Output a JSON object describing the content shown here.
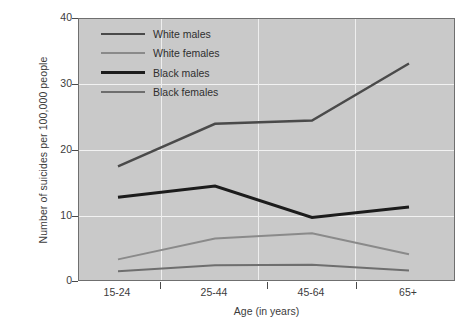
{
  "chart_data": {
    "type": "line",
    "title": "",
    "xlabel": "Age (in years)",
    "ylabel": "Number of suicides per 100,000 people",
    "categories": [
      "15-24",
      "25-44",
      "45-64",
      "65+"
    ],
    "yticks": [
      "0",
      "10",
      "20",
      "30",
      "40"
    ],
    "ylim": [
      0,
      40
    ],
    "grid": true,
    "legend_position": "top-left-inside",
    "plot_background": "#c9c9c9",
    "series": [
      {
        "name": "White males",
        "values": [
          17.5,
          24.0,
          24.5,
          33.2
        ],
        "color": "#4a4a4a",
        "width": 2.4
      },
      {
        "name": "White females",
        "values": [
          3.3,
          6.5,
          7.3,
          4.1
        ],
        "color": "#8a8a8a",
        "width": 2.0
      },
      {
        "name": "Black males",
        "values": [
          12.8,
          14.5,
          9.7,
          11.3
        ],
        "color": "#1c1c1c",
        "width": 3.0
      },
      {
        "name": "Black females",
        "values": [
          1.5,
          2.4,
          2.5,
          1.6
        ],
        "color": "#6e6e6e",
        "width": 2.0
      }
    ]
  },
  "legend": {
    "items": [
      {
        "label": "White males"
      },
      {
        "label": "White females"
      },
      {
        "label": "Black males"
      },
      {
        "label": "Black females"
      }
    ]
  },
  "axes": {
    "y_title": "Number of suicides per 100,000 people",
    "x_title": "Age (in years)"
  }
}
